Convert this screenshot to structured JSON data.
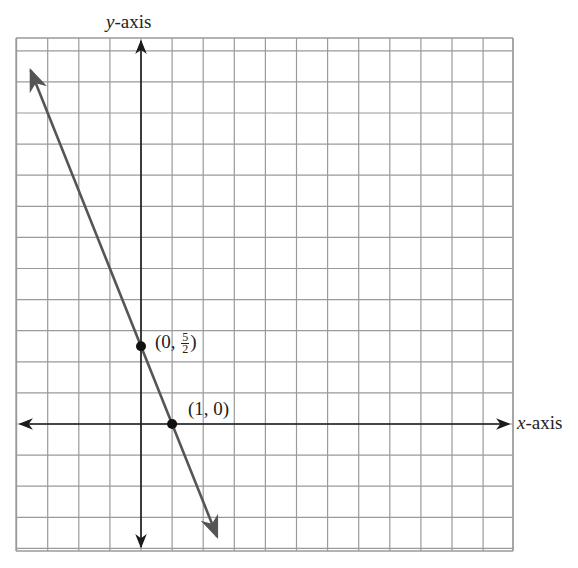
{
  "chart_data": {
    "type": "line",
    "title": "",
    "xlabel": "x-axis",
    "ylabel": "y-axis",
    "grid": true,
    "xlim": [
      -4,
      12
    ],
    "ylim": [
      -4,
      12.4
    ],
    "equation": "y = -5/2 x + 5/2",
    "series": [
      {
        "name": "line",
        "x": [
          -3.55,
          2.45
        ],
        "y": [
          11.375,
          -3.625
        ],
        "arrows": "both"
      }
    ],
    "points": [
      {
        "x": 0,
        "y": 2.5,
        "label_prefix": "(0, ",
        "label_num": "5",
        "label_den": "2",
        "label_suffix": ")"
      },
      {
        "x": 1,
        "y": 0,
        "label": "(1, 0)"
      }
    ],
    "axis_labels": {
      "x_var": "x",
      "x_rest": "-axis",
      "y_var": "y",
      "y_rest": "-axis"
    }
  },
  "colors": {
    "grid": "#9a9a9a",
    "axis": "#1a1a1a",
    "line": "#555555",
    "point": "#111111"
  }
}
